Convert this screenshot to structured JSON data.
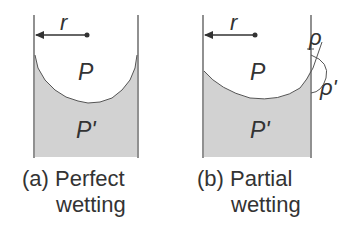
{
  "panels": [
    {
      "id": "a",
      "caption_line1": "(a) Perfect",
      "caption_line2": "wetting",
      "radius_label": "r",
      "upper_label": "P",
      "lower_label": "P'"
    },
    {
      "id": "b",
      "caption_line1": "(b) Partial",
      "caption_line2": "wetting",
      "radius_label": "r",
      "upper_label": "P",
      "lower_label": "P'",
      "contact_labels": [
        "ρ",
        "ρ'"
      ]
    }
  ],
  "colors": {
    "liquid": "#cfcfcf",
    "line": "#555555",
    "text": "#333333"
  }
}
